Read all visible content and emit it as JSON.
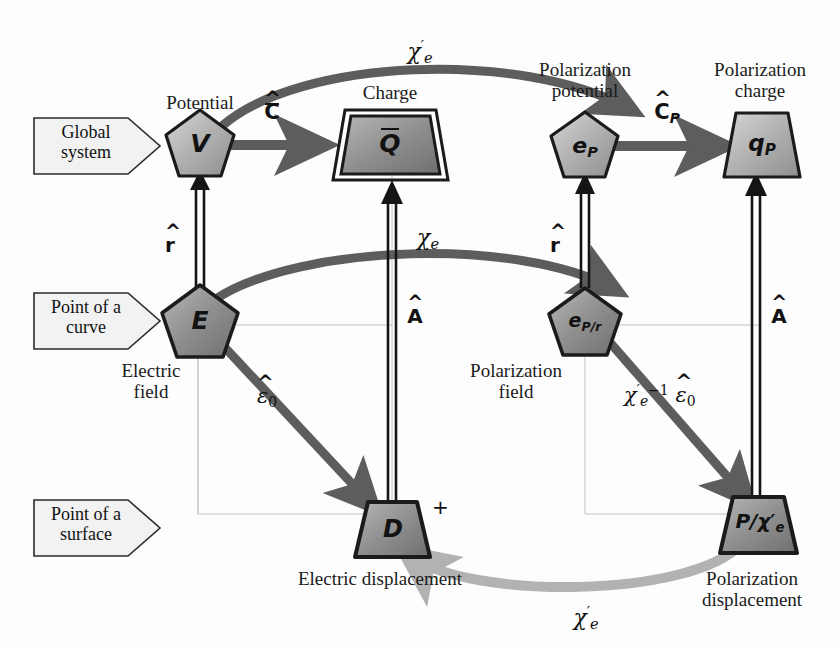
{
  "diagram": {
    "colors": {
      "node_fill_light": "#c9c9c9",
      "node_fill_mid": "#a9a9a9",
      "node_fill_dark": "#8d8d8d",
      "node_stroke": "#1b1b1b",
      "arrow_dark": "#5d5d5d",
      "arrow_black": "#111111",
      "arrow_light": "#b2b2b2",
      "grid_line": "#b9b9b9",
      "band_fill": "#f2f2f2",
      "band_stroke": "#2a2a2a",
      "text": "#1b1b1b"
    },
    "bands": [
      {
        "id": "band-global",
        "lines": [
          "Global",
          "system"
        ],
        "text": "Global system"
      },
      {
        "id": "band-curve",
        "lines": [
          "Point of a",
          "curve"
        ],
        "text": "Point of a curve"
      },
      {
        "id": "band-surface",
        "lines": [
          "Point of a",
          "surface"
        ],
        "text": "Point of a surface"
      }
    ],
    "nodes": [
      {
        "id": "node-v",
        "symbol": "V",
        "shape": "pentagon",
        "caption": "Potential",
        "caption_lines": [
          "Potential"
        ]
      },
      {
        "id": "node-q",
        "symbol": "Q",
        "symbol_overbar": true,
        "shape": "trapezoid-double",
        "caption": "Charge",
        "caption_lines": [
          "Charge"
        ]
      },
      {
        "id": "node-ep",
        "symbol": "e",
        "symbol_sub": "P",
        "shape": "pentagon",
        "caption": "Polarization potential",
        "caption_lines": [
          "Polarization",
          "potential"
        ]
      },
      {
        "id": "node-qp",
        "symbol": "q",
        "symbol_sub": "P",
        "shape": "trapezoid",
        "caption": "Polarization charge",
        "caption_lines": [
          "Polarization",
          "charge"
        ]
      },
      {
        "id": "node-e",
        "symbol": "E",
        "shape": "pentagon",
        "caption": "Electric field",
        "caption_lines": [
          "Electric",
          "field"
        ]
      },
      {
        "id": "node-epr",
        "symbol": "e",
        "symbol_sub": "P/r",
        "shape": "pentagon",
        "caption": "Polarization field",
        "caption_lines": [
          "Polarization",
          "field"
        ]
      },
      {
        "id": "node-d",
        "symbol": "D",
        "shape": "trapezoid",
        "caption": "Electric displacement",
        "caption_lines": [
          "Electric displacement"
        ],
        "marker": "+"
      },
      {
        "id": "node-pchi",
        "symbol": "P/χ",
        "symbol_sub": "e",
        "symbol_prime": true,
        "shape": "trapezoid",
        "caption": "Polarization displacement",
        "caption_lines": [
          "Polarization",
          "displacement"
        ]
      }
    ],
    "edges": [
      {
        "id": "edge-v-q",
        "label": "C",
        "label_hat": true,
        "label_bar": true,
        "from": "node-v",
        "to": "node-q",
        "style": "straight-dark"
      },
      {
        "id": "edge-ep-qp",
        "label": "C",
        "label_hat": true,
        "label_sub": "P",
        "from": "node-ep",
        "to": "node-qp",
        "style": "straight-dark"
      },
      {
        "id": "edge-v-ep",
        "label": "χ",
        "label_sub": "e",
        "label_prime": true,
        "from": "node-v",
        "to": "node-ep",
        "style": "curved-dark-top"
      },
      {
        "id": "edge-e-epr",
        "label": "χ",
        "label_sub": "e",
        "from": "node-e",
        "to": "node-epr",
        "style": "curved-dark-mid"
      },
      {
        "id": "edge-e-v",
        "label": "r",
        "label_hat": true,
        "label_bold": true,
        "from": "node-e",
        "to": "node-v",
        "style": "double-line-up"
      },
      {
        "id": "edge-epr-ep",
        "label": "r",
        "label_hat": true,
        "label_bold": true,
        "from": "node-epr",
        "to": "node-ep",
        "style": "double-line-up"
      },
      {
        "id": "edge-d-q",
        "label": "A",
        "label_hat": true,
        "label_bold": true,
        "from": "node-d",
        "to": "node-q",
        "style": "double-line-up"
      },
      {
        "id": "edge-pchi-qp",
        "label": "A",
        "label_hat": true,
        "label_bold": true,
        "from": "node-pchi",
        "to": "node-qp",
        "style": "double-line-up"
      },
      {
        "id": "edge-e-d",
        "label": "ε",
        "label_hat": true,
        "label_sub": "0",
        "from": "node-e",
        "to": "node-d",
        "style": "diagonal-dark"
      },
      {
        "id": "edge-epr-pchi",
        "label": "χ",
        "label_sub": "e",
        "label_prime": true,
        "label_sup": "−1",
        "label_tail": "ε",
        "label_tail_hat": true,
        "label_tail_sub": "0",
        "from": "node-epr",
        "to": "node-pchi",
        "style": "diagonal-dark"
      },
      {
        "id": "edge-pchi-d",
        "label": "χ",
        "label_sub": "e",
        "label_prime": true,
        "from": "node-pchi",
        "to": "node-d",
        "style": "curved-light-bottom"
      }
    ],
    "edge_labels": {
      "c_hat_bar": "C",
      "c_hat_p": "C",
      "chi_e_prime_top": "χ",
      "chi_e_mid": "χ",
      "r_hat_left": "r",
      "r_hat_right": "r",
      "a_hat_left": "A",
      "a_hat_right": "A",
      "eps_hat_0": "ε",
      "chi_inv_eps": "χ",
      "chi_e_prime_bottom": "χ",
      "sub_p": "P",
      "sub_e": "e",
      "sub_0": "0",
      "sup_neg1": "−1",
      "prime": "′"
    },
    "captions": {
      "potential": "Potential",
      "charge": "Charge",
      "polarization_potential_l1": "Polarization",
      "polarization_potential_l2": "potential",
      "polarization_charge_l1": "Polarization",
      "polarization_charge_l2": "charge",
      "electric_field_l1": "Electric",
      "electric_field_l2": "field",
      "polarization_field_l1": "Polarization",
      "polarization_field_l2": "field",
      "electric_displacement": "Electric displacement",
      "polarization_displacement_l1": "Polarization",
      "polarization_displacement_l2": "displacement"
    },
    "band_labels": {
      "global_l1": "Global",
      "global_l2": "system",
      "curve_l1": "Point of a",
      "curve_l2": "curve",
      "surface_l1": "Point of a",
      "surface_l2": "surface"
    },
    "node_symbols": {
      "v": "V",
      "q": "Q",
      "ep": "e",
      "ep_sub": "P",
      "qp": "q",
      "qp_sub": "P",
      "e": "E",
      "epr": "e",
      "epr_sub": "P/r",
      "d": "D",
      "d_marker": "+",
      "pchi": "P/χ",
      "pchi_sub": "e"
    }
  }
}
